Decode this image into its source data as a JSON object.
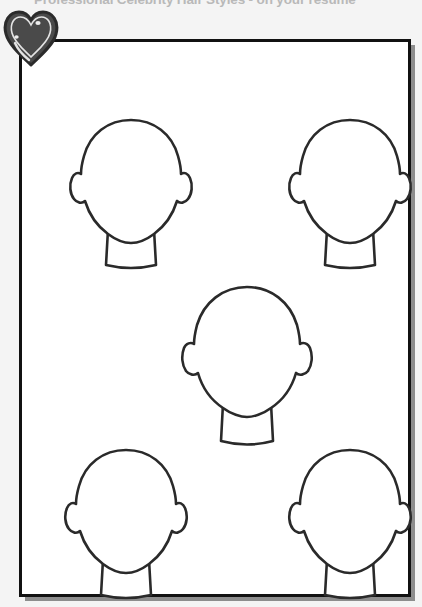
{
  "page": {
    "title": "Professional Celebrity Hair Styles - on your resume",
    "background_color": "#f4f4f4",
    "sheet_color": "#ffffff",
    "border_color": "#111111",
    "shadow_color": "#8d8d8d",
    "title_color": "#b9b9b9"
  },
  "badge": {
    "icon_name": "heart-icon",
    "fill_color": "#4a4a4a",
    "outline_color": "#2b2b2b",
    "highlight_color": "#ffffff"
  },
  "worksheet": {
    "description": "Blank head and face outline templates for sketching hairstyles",
    "outline_color": "#2a2a2a",
    "fill_color": "#ffffff",
    "template_count": 5,
    "layout": "quincunx",
    "templates": [
      {
        "id": "head-top-left",
        "label": "Head template 1",
        "position": "top-left",
        "size": "standard"
      },
      {
        "id": "head-top-right",
        "label": "Head template 2",
        "position": "top-right",
        "size": "standard"
      },
      {
        "id": "head-center",
        "label": "Head template 3",
        "position": "center",
        "size": "large"
      },
      {
        "id": "head-bottom-left",
        "label": "Head template 4",
        "position": "bottom-left",
        "size": "standard"
      },
      {
        "id": "head-bottom-right",
        "label": "Head template 5",
        "position": "bottom-right",
        "size": "standard"
      }
    ]
  }
}
